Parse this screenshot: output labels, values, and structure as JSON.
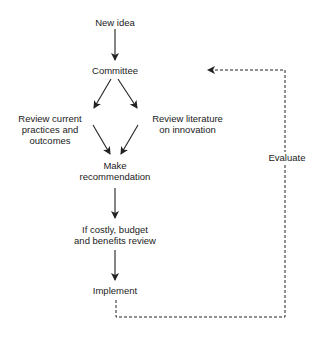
{
  "diagram": {
    "nodes": {
      "new_idea": "New idea",
      "committee": "Committee",
      "review_current_1": "Review current",
      "review_current_2": "practices and",
      "review_current_3": "outcomes",
      "review_lit_1": "Review literature",
      "review_lit_2": "on innovation",
      "make_rec_1": "Make",
      "make_rec_2": "recommendation",
      "budget_1": "If costly, budget",
      "budget_2": "and benefits review",
      "implement": "Implement"
    },
    "feedback_label": "Evaluate",
    "edges": [
      {
        "from": "New idea",
        "to": "Committee",
        "style": "solid"
      },
      {
        "from": "Committee",
        "to": "Review current practices and outcomes",
        "style": "solid"
      },
      {
        "from": "Committee",
        "to": "Review literature on innovation",
        "style": "solid"
      },
      {
        "from": "Review current practices and outcomes",
        "to": "Make recommendation",
        "style": "solid"
      },
      {
        "from": "Review literature on innovation",
        "to": "Make recommendation",
        "style": "solid"
      },
      {
        "from": "Make recommendation",
        "to": "If costly, budget and benefits review",
        "style": "solid"
      },
      {
        "from": "If costly, budget and benefits review",
        "to": "Implement",
        "style": "solid"
      },
      {
        "from": "Implement",
        "to": "Committee",
        "style": "dashed",
        "label": "Evaluate"
      }
    ]
  }
}
